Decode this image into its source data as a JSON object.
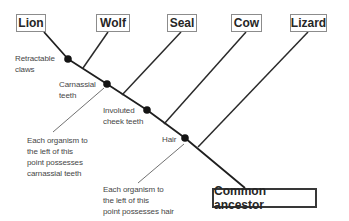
{
  "diagram_type": "cladogram",
  "colors": {
    "background": "#ffffff",
    "trunk_line": "#1f1f1f",
    "branch_line": "#2a2a2a",
    "pointer_line": "#4d4d4d",
    "node_dot": "#141414",
    "label_text": "#464646",
    "box_text": "#262626",
    "box_border": "#8c8c8c",
    "ancestor_border": "#383838"
  },
  "taxa": [
    {
      "label": "Lion",
      "box": {
        "x": 16,
        "y": 14,
        "w": 30,
        "h": 18
      }
    },
    {
      "label": "Wolf",
      "box": {
        "x": 96,
        "y": 14,
        "w": 34,
        "h": 18
      }
    },
    {
      "label": "Seal",
      "box": {
        "x": 167,
        "y": 14,
        "w": 30,
        "h": 18
      }
    },
    {
      "label": "Cow",
      "box": {
        "x": 231,
        "y": 14,
        "w": 31,
        "h": 18
      }
    },
    {
      "label": "Lizard",
      "box": {
        "x": 290,
        "y": 14,
        "w": 37,
        "h": 18
      }
    }
  ],
  "ancestor": {
    "label": "Common ancestor",
    "box": {
      "x": 212,
      "y": 188,
      "w": 105,
      "h": 20
    }
  },
  "trunk_points": "44,32 68,59 107,84 147,110 185,138 245,188",
  "branches": [
    {
      "to_taxon": "wolf",
      "x1": 108,
      "y1": 32,
      "x2": 83,
      "y2": 68
    },
    {
      "to_taxon": "seal",
      "x1": 181,
      "y1": 32,
      "x2": 122,
      "y2": 95
    },
    {
      "to_taxon": "cow",
      "x1": 246,
      "y1": 32,
      "x2": 164,
      "y2": 124
    },
    {
      "to_taxon": "lizard",
      "x1": 308,
      "y1": 32,
      "x2": 198,
      "y2": 147
    }
  ],
  "nodes": [
    {
      "trait": "retractable-claws",
      "cx": 68,
      "cy": 59
    },
    {
      "trait": "carnassial-teeth",
      "cx": 107,
      "cy": 84
    },
    {
      "trait": "involuted-cheek-teeth",
      "cx": 147,
      "cy": 110
    },
    {
      "trait": "hair",
      "cx": 185,
      "cy": 138
    }
  ],
  "trait_labels": [
    {
      "name": "retractable-claws",
      "lines": [
        "Retractable",
        "claws"
      ],
      "x": 15,
      "y": 53
    },
    {
      "name": "carnassial-teeth",
      "lines": [
        "Carnassial",
        "teeth"
      ],
      "x": 59,
      "y": 79
    },
    {
      "name": "involuted-cheek-teeth",
      "lines": [
        "Involuted",
        "cheek teeth"
      ],
      "x": 103,
      "y": 105
    },
    {
      "name": "hair",
      "lines": [
        "Hair"
      ],
      "x": 162,
      "y": 134
    }
  ],
  "annotations": [
    {
      "name": "carnassial-note",
      "lines": [
        "Each organism to",
        "the left of this",
        "point possesses",
        "carnassial teeth"
      ],
      "x": 27,
      "y": 135,
      "pointer": {
        "x1": 53,
        "y1": 132,
        "x2": 104,
        "y2": 88
      }
    },
    {
      "name": "hair-note",
      "lines": [
        "Each organism to",
        "the left of this",
        "point possesses hair"
      ],
      "x": 103,
      "y": 184,
      "pointer": {
        "x1": 138,
        "y1": 183,
        "x2": 184,
        "y2": 144
      }
    }
  ]
}
